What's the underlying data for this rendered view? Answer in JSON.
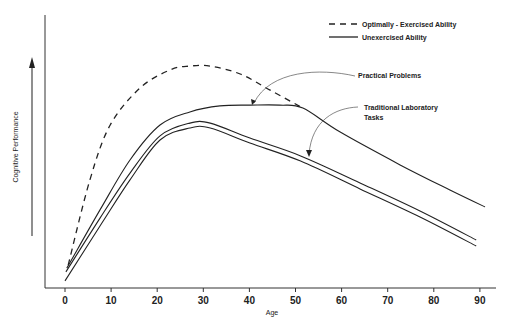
{
  "chart_data": {
    "type": "line",
    "title": "",
    "xlabel": "Age",
    "ylabel": "Cognitive Performance",
    "xlim": [
      -4,
      93
    ],
    "ylim": [
      0,
      100
    ],
    "x_ticks": [
      0,
      10,
      20,
      30,
      40,
      50,
      60,
      70,
      80,
      90
    ],
    "grid": false,
    "legend_position": "top-right",
    "legend": [
      {
        "label": "Optimally - Exercised Ability",
        "style": "dashed"
      },
      {
        "label": "Unexercised Ability",
        "style": "solid"
      }
    ],
    "annotations": [
      {
        "text": "Practical Problems",
        "points_to_series": "Practical Problems (Unexercised)",
        "at_age": 40
      },
      {
        "text": "Traditional Laboratory Tasks",
        "text_line2": "",
        "points_to_series": "Traditional Laboratory Tasks (Unexercised)",
        "at_age": 53
      }
    ],
    "annotation_lines": {
      "practical": [
        "Practical Problems"
      ],
      "lab": [
        "Traditional Laboratory",
        "Tasks"
      ]
    },
    "series": [
      {
        "name": "Optimally-Exercised Ability",
        "style": "dashed",
        "x": [
          0.7,
          5.4,
          9.8,
          16.3,
          22.8,
          27.1,
          31.5,
          38.0,
          44.5,
          51.6
        ],
        "y": [
          8.4,
          39.6,
          59.7,
          73.3,
          79.9,
          81.3,
          81.3,
          78.4,
          72.5,
          65.9
        ]
      },
      {
        "name": "Practical Problems (Unexercised)",
        "style": "solid",
        "x": [
          0.4,
          7.6,
          14.1,
          20.6,
          27.1,
          33.6,
          40.1,
          46.6,
          51.6,
          59.7,
          72.7,
          83.5,
          91.1
        ],
        "y": [
          7.3,
          28.6,
          46.9,
          59.7,
          64.5,
          66.7,
          67.0,
          67.0,
          65.9,
          57.1,
          45.1,
          35.9,
          29.7
        ]
      },
      {
        "name": "Traditional Laboratory Tasks (Unexercised) - upper",
        "style": "solid",
        "x": [
          0.2,
          7.6,
          14.1,
          20.6,
          27.1,
          31.5,
          40.1,
          51.1,
          64.0,
          77.0,
          89.2
        ],
        "y": [
          5.9,
          25.6,
          42.1,
          55.7,
          60.4,
          60.4,
          54.9,
          48.4,
          38.5,
          28.2,
          17.6
        ]
      },
      {
        "name": "Traditional Laboratory Tasks (Unexercised) - lower",
        "style": "solid",
        "x": [
          0.0,
          7.6,
          14.1,
          20.6,
          27.1,
          31.5,
          40.1,
          51.1,
          64.0,
          77.0,
          89.2
        ],
        "y": [
          2.6,
          22.7,
          39.6,
          54.2,
          58.6,
          58.6,
          53.1,
          46.5,
          36.3,
          26.0,
          15.4
        ]
      }
    ]
  }
}
